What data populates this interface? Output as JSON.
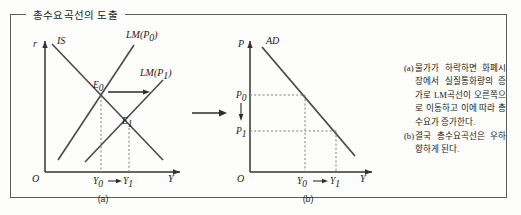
{
  "figure": {
    "title": "총수요곡선의 도출",
    "panels": [
      {
        "id": "a",
        "caption": "(a)",
        "y_axis_label": "r",
        "x_axis_label": "Y",
        "origin_label": "O",
        "curves": [
          {
            "name": "IS",
            "label": "IS",
            "slope": "downward"
          },
          {
            "name": "LM0",
            "label": "LM(P",
            "label_sub": "0",
            "label_close": ")",
            "slope": "upward"
          },
          {
            "name": "LM1",
            "label": "LM(P",
            "label_sub": "1",
            "label_close": ")",
            "slope": "upward"
          }
        ],
        "points": [
          {
            "name": "E0",
            "label": "E",
            "sub": "0"
          },
          {
            "name": "E1",
            "label": "E",
            "sub": "1"
          }
        ],
        "x_ticks": [
          {
            "label": "Y",
            "sub": "0"
          },
          {
            "label": "Y",
            "sub": "1"
          }
        ],
        "shift_arrow": "rightward"
      },
      {
        "id": "b",
        "caption": "(b)",
        "y_axis_label": "P",
        "x_axis_label": "Y",
        "origin_label": "O",
        "curves": [
          {
            "name": "AD",
            "label": "AD",
            "slope": "downward"
          }
        ],
        "y_ticks": [
          {
            "label": "P",
            "sub": "0"
          },
          {
            "label": "P",
            "sub": "1"
          }
        ],
        "x_ticks": [
          {
            "label": "Y",
            "sub": "0"
          },
          {
            "label": "Y",
            "sub": "1"
          }
        ],
        "shift_arrow": "downward"
      }
    ],
    "connector_arrow": "rightward",
    "notes": [
      {
        "marker": "(a)",
        "text": "물가가 하락하면 화폐시장에서 실질통화량의 증가로 LM곡선이 오른쪽으로 이동하고 이에 따라 총수요가 증가한다."
      },
      {
        "marker": "(b)",
        "text": "결국 총수요곡선은 우하향하게 된다."
      }
    ]
  },
  "colors": {
    "frame": "#5b5b5b",
    "axis": "#333333",
    "curve": "#4a4a4a",
    "dashed": "#7a7a7a",
    "text": "#1a1a1a"
  }
}
